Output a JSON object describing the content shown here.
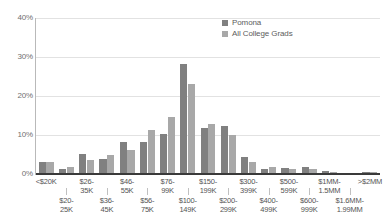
{
  "chart_data": {
    "type": "bar",
    "title": "",
    "xlabel": "",
    "ylabel": "",
    "ylim": [
      0,
      40
    ],
    "yticks": [
      0,
      10,
      20,
      30,
      40
    ],
    "ytick_labels": [
      "0%",
      "10%",
      "20%",
      "30%",
      "40%"
    ],
    "grid": true,
    "legend_position": "top-right",
    "categories": [
      "<$20K",
      "$20-\n25K",
      "$26-\n35K",
      "$36-\n45K",
      "$46-\n55K",
      "$56-\n75K",
      "$76-\n99K",
      "$100-\n149K",
      "$150-\n199K",
      "$200-\n299K",
      "$300-\n399K",
      "$400-\n499K",
      "$500-\n599K",
      "$600-\n999K",
      "$1MM-\n1.5MM",
      "$1.6MM-\n1.99MM",
      ">$2MM"
    ],
    "series": [
      {
        "name": "Pomona",
        "color": "#808080",
        "values": [
          3.0,
          1.3,
          5.2,
          3.9,
          8.2,
          8.2,
          10.3,
          28.2,
          11.7,
          12.4,
          4.3,
          1.3,
          1.6,
          1.9,
          0.8,
          0.2,
          0.4
        ]
      },
      {
        "name": "All College Grads",
        "color": "#a8a8a8",
        "values": [
          3.1,
          1.9,
          3.7,
          5.0,
          6.2,
          11.2,
          14.7,
          23.2,
          12.8,
          10.0,
          3.0,
          1.7,
          1.3,
          1.2,
          0.6,
          0.2,
          0.5
        ]
      }
    ]
  },
  "legend": {
    "items": [
      {
        "label": "Pomona",
        "color": "#808080"
      },
      {
        "label": "All College Grads",
        "color": "#a8a8a8"
      }
    ]
  },
  "axis": {
    "y_tick_labels": [
      "40%",
      "30%",
      "20%",
      "10%",
      "0%"
    ]
  }
}
